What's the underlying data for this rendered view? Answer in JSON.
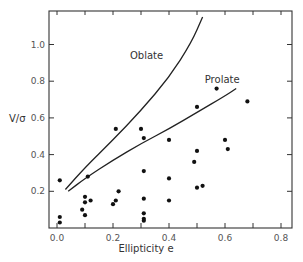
{
  "chart_data": {
    "type": "scatter",
    "title": "",
    "xlabel": "Ellipticity e",
    "ylabel": "V/σ",
    "xlim": [
      -0.02,
      0.84
    ],
    "ylim": [
      0.0,
      1.18
    ],
    "x_ticks": [
      0.0,
      0.2,
      0.4,
      0.6,
      0.8
    ],
    "x_tick_labels": [
      "0.0",
      "0.2",
      "0.4",
      "0.6",
      "0.8"
    ],
    "x_minor_ticks": [
      0.1,
      0.3,
      0.5,
      0.7
    ],
    "y_ticks": [
      0.2,
      0.4,
      0.6,
      0.8,
      1.0
    ],
    "y_tick_labels": [
      "0.2",
      "0.4",
      "0.6",
      "0.8",
      "1.0"
    ],
    "grid": false,
    "legend": null,
    "series": [
      {
        "name": "Observed galaxies",
        "kind": "scatter",
        "points": [
          [
            0.01,
            0.26
          ],
          [
            0.01,
            0.06
          ],
          [
            0.01,
            0.03
          ],
          [
            0.09,
            0.1
          ],
          [
            0.1,
            0.17
          ],
          [
            0.1,
            0.14
          ],
          [
            0.1,
            0.07
          ],
          [
            0.12,
            0.15
          ],
          [
            0.11,
            0.28
          ],
          [
            0.2,
            0.13
          ],
          [
            0.21,
            0.15
          ],
          [
            0.22,
            0.2
          ],
          [
            0.21,
            0.54
          ],
          [
            0.3,
            0.54
          ],
          [
            0.31,
            0.49
          ],
          [
            0.31,
            0.31
          ],
          [
            0.31,
            0.16
          ],
          [
            0.31,
            0.08
          ],
          [
            0.31,
            0.05
          ],
          [
            0.31,
            0.04
          ],
          [
            0.4,
            0.48
          ],
          [
            0.4,
            0.27
          ],
          [
            0.4,
            0.15
          ],
          [
            0.49,
            0.36
          ],
          [
            0.5,
            0.42
          ],
          [
            0.5,
            0.22
          ],
          [
            0.52,
            0.23
          ],
          [
            0.5,
            0.66
          ],
          [
            0.6,
            0.48
          ],
          [
            0.61,
            0.43
          ],
          [
            0.57,
            0.76
          ],
          [
            0.68,
            0.69
          ]
        ]
      },
      {
        "name": "Oblate",
        "kind": "line",
        "points": [
          [
            0.03,
            0.21
          ],
          [
            0.1,
            0.33
          ],
          [
            0.2,
            0.48
          ],
          [
            0.3,
            0.64
          ],
          [
            0.4,
            0.82
          ],
          [
            0.48,
            1.01
          ],
          [
            0.52,
            1.15
          ]
        ]
      },
      {
        "name": "Prolate",
        "kind": "line",
        "points": [
          [
            0.04,
            0.2
          ],
          [
            0.1,
            0.27
          ],
          [
            0.2,
            0.37
          ],
          [
            0.3,
            0.46
          ],
          [
            0.4,
            0.54
          ],
          [
            0.5,
            0.63
          ],
          [
            0.6,
            0.72
          ],
          [
            0.64,
            0.76
          ]
        ]
      }
    ],
    "annotations": [
      {
        "text": "Oblate",
        "x": 0.32,
        "y": 0.92
      },
      {
        "text": "Prolate",
        "x": 0.59,
        "y": 0.79
      }
    ]
  }
}
